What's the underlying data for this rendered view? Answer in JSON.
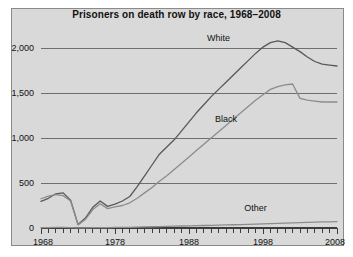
{
  "figure": {
    "background": "#ffffff",
    "panel_background": "#d9d9d9",
    "panel_border": "#8a8a8a"
  },
  "chart_data": {
    "type": "line",
    "title": "Prisoners on death row by race, 1968–2008",
    "xlabel": "",
    "ylabel": "",
    "xlim": [
      1968,
      2008
    ],
    "ylim": [
      0,
      2200
    ],
    "grid": true,
    "gridlines_y": [
      500,
      1000,
      1500,
      2000
    ],
    "legend_position": "inline-labels",
    "y_ticks": [
      0,
      500,
      1000,
      1500,
      2000
    ],
    "y_tick_labels": [
      "0",
      "500",
      "1,000",
      "1,500",
      "2,000"
    ],
    "x_ticks": [
      1968,
      1978,
      1988,
      1998,
      2008
    ],
    "x_tick_labels": [
      "1968",
      "1978",
      "1988",
      "1998",
      "2008"
    ],
    "x_minor_tick_step": 1,
    "x": [
      1968,
      1969,
      1970,
      1971,
      1972,
      1973,
      1974,
      1975,
      1976,
      1977,
      1978,
      1979,
      1980,
      1981,
      1982,
      1983,
      1984,
      1985,
      1986,
      1987,
      1988,
      1989,
      1990,
      1991,
      1992,
      1993,
      1994,
      1995,
      1996,
      1997,
      1998,
      1999,
      2000,
      2001,
      2002,
      2003,
      2004,
      2005,
      2006,
      2007,
      2008
    ],
    "series": [
      {
        "name": "White",
        "color": "#585858",
        "label_x": 1992,
        "label_y": 2080,
        "values": [
          295,
          330,
          380,
          390,
          310,
          40,
          110,
          230,
          300,
          240,
          265,
          300,
          350,
          460,
          580,
          700,
          820,
          900,
          980,
          1080,
          1180,
          1280,
          1370,
          1460,
          1540,
          1620,
          1700,
          1780,
          1860,
          1940,
          2010,
          2060,
          2080,
          2060,
          2010,
          1960,
          1900,
          1850,
          1820,
          1810,
          1800
        ]
      },
      {
        "name": "Black",
        "color": "#8c8c8c",
        "label_x": 1993,
        "label_y": 1180,
        "values": [
          325,
          355,
          370,
          360,
          300,
          35,
          95,
          205,
          270,
          215,
          235,
          250,
          280,
          330,
          390,
          450,
          520,
          580,
          650,
          720,
          790,
          860,
          930,
          1000,
          1070,
          1140,
          1210,
          1280,
          1350,
          1420,
          1480,
          1540,
          1570,
          1590,
          1600,
          1440,
          1420,
          1410,
          1400,
          1400,
          1400
        ]
      },
      {
        "name": "Other",
        "color": "#8c8c8c",
        "label_x": 1997,
        "label_y": 190,
        "values": [
          4,
          5,
          6,
          6,
          5,
          1,
          2,
          4,
          5,
          5,
          6,
          7,
          8,
          10,
          12,
          14,
          16,
          18,
          20,
          22,
          24,
          26,
          28,
          30,
          32,
          34,
          36,
          38,
          40,
          42,
          45,
          48,
          52,
          55,
          58,
          60,
          62,
          65,
          67,
          69,
          70
        ]
      }
    ]
  }
}
